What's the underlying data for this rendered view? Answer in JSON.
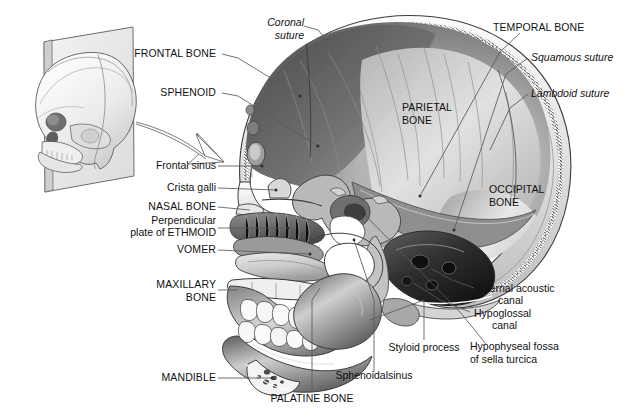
{
  "figure": {
    "background_color": "#ffffff",
    "line_color": "#4a4a4a",
    "text_color": "#111111"
  },
  "inset": {
    "name": "skull-orientation-inset",
    "description": "Three-quarter view of a skull intersected by a midsagittal cutting plane"
  },
  "labels": {
    "frontal_bone": "FRONTAL BONE",
    "sphenoid": "SPHENOID",
    "frontal_sinus": "Frontal sinus",
    "crista_galli": "Crista galli",
    "nasal_bone": "NASAL BONE",
    "perpendicular_plate_l1": "Perpendicular",
    "perpendicular_plate_l2": "plate of ETHMOID",
    "vomer": "VOMER",
    "maxillary_bone_l1": "MAXILLARY",
    "maxillary_bone_l2": "BONE",
    "mandible": "MANDIBLE",
    "palatine_bone": "PALATINE BONE",
    "sphenoidal_sinus": "Sphenoidalsinus",
    "styloid_process": "Styloid process",
    "coronal_suture_l1": "Coronal",
    "coronal_suture_l2": "suture",
    "temporal_bone": "TEMPORAL BONE",
    "squamous_suture": "Squamous suture",
    "lambdoid_suture": "Lambdoid suture",
    "parietal_bone_l1": "PARIETAL",
    "parietal_bone_l2": "BONE",
    "occipital_bone_l1": "OCCIPITAL",
    "occipital_bone_l2": "BONE",
    "internal_acoustic_l1": "Internal acoustic",
    "internal_acoustic_l2": "canal",
    "hypoglossal_l1": "Hypoglossal",
    "hypoglossal_l2": "canal",
    "hypophyseal_l1": "Hypophyseal fossa",
    "hypophyseal_l2": "of sella turcica"
  }
}
